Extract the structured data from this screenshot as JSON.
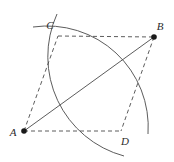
{
  "figure": {
    "width": 174,
    "height": 162,
    "background_color": "#ffffff",
    "stroke_color": "#4a4a4a",
    "label_color": "#2b2b2b",
    "dot_color": "#1a1a1a",
    "points": [
      {
        "id": "A",
        "label": "A",
        "x": 24,
        "y": 131,
        "dot": true,
        "label_x": 13,
        "label_y": 136
      },
      {
        "id": "B",
        "label": "B",
        "x": 154,
        "y": 37,
        "dot": true,
        "label_x": 160,
        "label_y": 30
      },
      {
        "id": "C",
        "label": "C",
        "x": 58,
        "y": 36,
        "dot": false,
        "label_x": 50,
        "label_y": 29
      },
      {
        "id": "D",
        "label": "D",
        "x": 121,
        "y": 131,
        "dot": false,
        "label_x": 125,
        "label_y": 145
      }
    ],
    "segments": [
      {
        "id": "AC",
        "from": "A",
        "to": "C",
        "style": "dashed"
      },
      {
        "id": "CB",
        "from": "C",
        "to": "B",
        "style": "dashed"
      },
      {
        "id": "BD",
        "from": "B",
        "to": "D",
        "style": "dashed"
      },
      {
        "id": "AD",
        "from": "A",
        "to": "D",
        "style": "dashed"
      },
      {
        "id": "AB",
        "from": "A",
        "to": "B",
        "style": "solid"
      }
    ],
    "arcs": [
      {
        "id": "arc-from-A",
        "center": "A",
        "through": [
          "C",
          "D"
        ],
        "path": "M 33 27 A 101 101 0 0 1 148 134",
        "style": "solid"
      },
      {
        "id": "arc-from-B",
        "center": "B",
        "through": [
          "C",
          "D"
        ],
        "path": "M 57 14 A 103 103 0 0 0 124 156",
        "style": "solid"
      }
    ],
    "dash_pattern": "4 3",
    "stroke_width": 0.9
  }
}
